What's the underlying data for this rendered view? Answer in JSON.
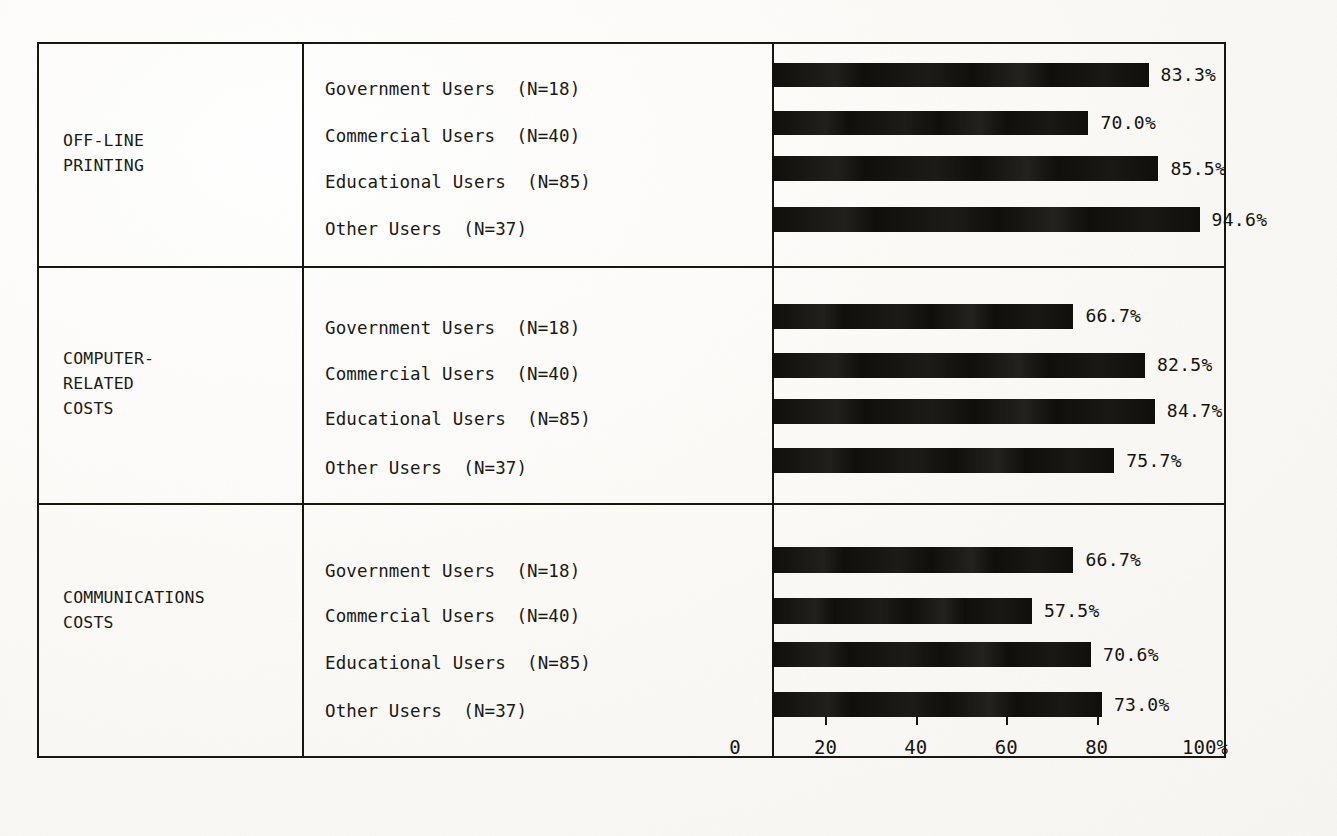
{
  "chart_data": {
    "type": "bar",
    "orientation": "horizontal",
    "title": "",
    "xlabel": "",
    "ylabel": "",
    "xlim": [
      0,
      100
    ],
    "grid": false,
    "legend": null,
    "axis": {
      "ticks": [
        0,
        20,
        40,
        60,
        80,
        100
      ],
      "tick_labels": [
        "0",
        "20",
        "40",
        "60",
        "80",
        "100%"
      ]
    },
    "categories": [
      "Government Users  (N=18)",
      "Commercial Users  (N=40)",
      "Educational Users  (N=85)",
      "Other Users  (N=37)"
    ],
    "groups": [
      {
        "label": "OFF-LINE\nPRINTING",
        "bars": [
          {
            "category": "Government Users  (N=18)",
            "value": 83.3,
            "value_label": "83.3%"
          },
          {
            "category": "Commercial Users  (N=40)",
            "value": 70.0,
            "value_label": "70.0%"
          },
          {
            "category": "Educational Users  (N=85)",
            "value": 85.5,
            "value_label": "85.5%"
          },
          {
            "category": "Other Users  (N=37)",
            "value": 94.6,
            "value_label": "94.6%"
          }
        ]
      },
      {
        "label": "COMPUTER-\nRELATED\nCOSTS",
        "bars": [
          {
            "category": "Government Users  (N=18)",
            "value": 66.7,
            "value_label": "66.7%"
          },
          {
            "category": "Commercial Users  (N=40)",
            "value": 82.5,
            "value_label": "82.5%"
          },
          {
            "category": "Educational Users  (N=85)",
            "value": 84.7,
            "value_label": "84.7%"
          },
          {
            "category": "Other Users  (N=37)",
            "value": 75.7,
            "value_label": "75.7%"
          }
        ]
      },
      {
        "label": "COMMUNICATIONS\nCOSTS",
        "bars": [
          {
            "category": "Government Users  (N=18)",
            "value": 66.7,
            "value_label": "66.7%"
          },
          {
            "category": "Commercial Users  (N=40)",
            "value": 57.5,
            "value_label": "57.5%"
          },
          {
            "category": "Educational Users  (N=85)",
            "value": 70.6,
            "value_label": "70.6%"
          },
          {
            "category": "Other Users  (N=37)",
            "value": 73.0,
            "value_label": "73.0%"
          }
        ]
      }
    ]
  },
  "colors": {
    "bar": "#100f0b",
    "rule": "#17160f",
    "text": "#17160f",
    "paper": "#fbfaf7"
  }
}
